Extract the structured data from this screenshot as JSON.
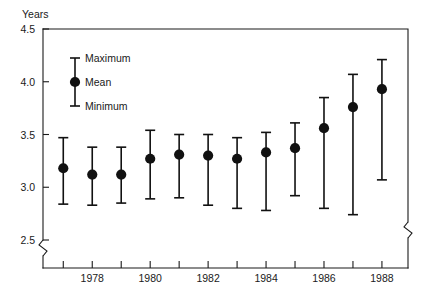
{
  "chart_data": {
    "type": "scatter",
    "title": "",
    "subtitle": "",
    "xlabel": "",
    "ylabel": "Years",
    "ylim": [
      2.5,
      4.5
    ],
    "yticks": [
      2.5,
      3.0,
      3.5,
      4.0,
      4.5
    ],
    "ytick_labels": [
      "2.5",
      "3.0",
      "3.5",
      "4.0",
      "4.5"
    ],
    "xlim": [
      1976.3,
      1988.9
    ],
    "xticks": [
      1977,
      1978,
      1979,
      1980,
      1981,
      1982,
      1983,
      1984,
      1985,
      1986,
      1987,
      1988
    ],
    "xtick_labels": [
      "",
      "1978",
      "",
      "1980",
      "",
      "1982",
      "",
      "1984",
      "",
      "1986",
      "",
      "1988"
    ],
    "grid": false,
    "y_axis_break": true,
    "legend_position": "inside-upper-left",
    "legend": [
      {
        "key": "maximum",
        "label": "Maximum"
      },
      {
        "key": "mean",
        "label": "Mean"
      },
      {
        "key": "minimum",
        "label": "Minimum"
      }
    ],
    "series": [
      {
        "name": "Maximum",
        "values": [
          3.47,
          3.38,
          3.38,
          3.54,
          3.5,
          3.5,
          3.47,
          3.52,
          3.61,
          3.85,
          4.07,
          4.21
        ]
      },
      {
        "name": "Mean",
        "values": [
          3.18,
          3.12,
          3.12,
          3.27,
          3.31,
          3.3,
          3.27,
          3.33,
          3.37,
          3.56,
          3.76,
          3.93
        ]
      },
      {
        "name": "Minimum",
        "values": [
          2.84,
          2.83,
          2.85,
          2.89,
          2.9,
          2.83,
          2.8,
          2.78,
          2.92,
          2.8,
          2.74,
          3.07
        ]
      }
    ],
    "x": [
      1977,
      1978,
      1979,
      1980,
      1981,
      1982,
      1983,
      1984,
      1985,
      1986,
      1987,
      1988
    ],
    "colors": {
      "marker": "#111111",
      "axis": "#1a1a1a",
      "background": "#ffffff"
    }
  }
}
